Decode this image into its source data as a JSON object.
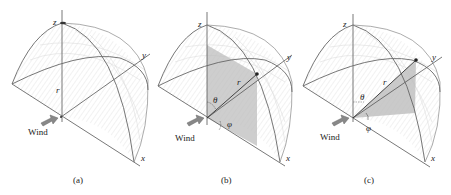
{
  "figure": {
    "panels": [
      {
        "id": "a",
        "caption": "(a)",
        "axis_labels": {
          "z": "z",
          "y": "y",
          "x": "x",
          "radius": "r"
        },
        "wind_label": "Wind"
      },
      {
        "id": "b",
        "caption": "(b)",
        "axis_labels": {
          "z": "z",
          "y": "y",
          "x": "x",
          "radius": "r"
        },
        "angle_labels": {
          "theta": "θ",
          "phi": "φ"
        },
        "wind_label": "Wind"
      },
      {
        "id": "c",
        "caption": "(c)",
        "axis_labels": {
          "z": "z",
          "y": "y",
          "x": "x",
          "radius": "r"
        },
        "angle_labels": {
          "theta": "θ",
          "phi": "φ"
        },
        "wind_label": "Wind"
      }
    ]
  }
}
